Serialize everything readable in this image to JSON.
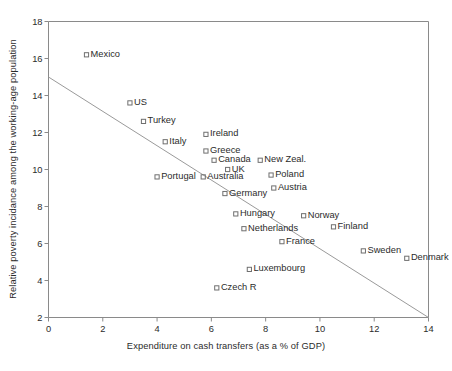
{
  "chart_data": {
    "type": "scatter",
    "title": "",
    "xlabel": "Expenditure on cash transfers (as a % of GDP)",
    "ylabel": "Relative poverty incidance among the working-age population",
    "xlim": [
      0,
      14
    ],
    "ylim": [
      2,
      18
    ],
    "xticks": [
      "0",
      "2",
      "4",
      "6",
      "8",
      "10",
      "12",
      "14"
    ],
    "xtick_values": [
      0,
      2,
      4,
      6,
      8,
      10,
      12,
      14
    ],
    "yticks": [
      "2",
      "4",
      "6",
      "8",
      "10",
      "12",
      "14",
      "16",
      "18"
    ],
    "ytick_values": [
      2,
      4,
      6,
      8,
      10,
      12,
      14,
      16,
      18
    ],
    "grid": false,
    "legend": "none",
    "marker": "open-square",
    "marker_color": "#6f6f6f",
    "line_color": "#9a9a9a",
    "axis_color": "#8a8a8a",
    "points": [
      {
        "label": "Mexico",
        "x": 1.4,
        "y": 16.2,
        "label_side": "right"
      },
      {
        "label": "US",
        "x": 3.0,
        "y": 13.6,
        "label_side": "right"
      },
      {
        "label": "Turkey",
        "x": 3.5,
        "y": 12.6,
        "label_side": "right"
      },
      {
        "label": "Italy",
        "x": 4.3,
        "y": 11.5,
        "label_side": "right"
      },
      {
        "label": "Ireland",
        "x": 5.8,
        "y": 11.9,
        "label_side": "right"
      },
      {
        "label": "Greece",
        "x": 5.8,
        "y": 11.0,
        "label_side": "right"
      },
      {
        "label": "Canada",
        "x": 6.1,
        "y": 10.5,
        "label_side": "right"
      },
      {
        "label": "New Zeal.",
        "x": 7.8,
        "y": 10.5,
        "label_side": "right"
      },
      {
        "label": "UK",
        "x": 6.6,
        "y": 10.0,
        "label_side": "right"
      },
      {
        "label": "Portugal",
        "x": 4.0,
        "y": 9.6,
        "label_side": "right"
      },
      {
        "label": "Australia",
        "x": 5.7,
        "y": 9.6,
        "label_side": "right"
      },
      {
        "label": "Poland",
        "x": 8.2,
        "y": 9.7,
        "label_side": "right"
      },
      {
        "label": "Austria",
        "x": 8.3,
        "y": 9.0,
        "label_side": "right"
      },
      {
        "label": "Germany",
        "x": 6.5,
        "y": 8.7,
        "label_side": "right"
      },
      {
        "label": "Hungary",
        "x": 6.9,
        "y": 7.6,
        "label_side": "right"
      },
      {
        "label": "Norway",
        "x": 9.4,
        "y": 7.5,
        "label_side": "right"
      },
      {
        "label": "Finland",
        "x": 10.5,
        "y": 6.9,
        "label_side": "right"
      },
      {
        "label": "Netherlands",
        "x": 7.2,
        "y": 6.8,
        "label_side": "right"
      },
      {
        "label": "France",
        "x": 8.6,
        "y": 6.1,
        "label_side": "right"
      },
      {
        "label": "Sweden",
        "x": 11.6,
        "y": 5.6,
        "label_side": "right"
      },
      {
        "label": "Denmark",
        "x": 13.2,
        "y": 5.2,
        "label_side": "right"
      },
      {
        "label": "Luxembourg",
        "x": 7.4,
        "y": 4.6,
        "label_side": "right"
      },
      {
        "label": "Czech R",
        "x": 6.2,
        "y": 3.6,
        "label_side": "right"
      }
    ],
    "trendline": {
      "x_start": 0,
      "y_start": 15.0,
      "x_end": 14,
      "y_end": 2.0
    }
  }
}
